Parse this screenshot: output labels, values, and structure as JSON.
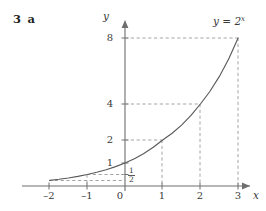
{
  "figure": {
    "question_label": "3 a",
    "function_label_prefix": "y = 2",
    "function_label_exponent": "x",
    "y_axis_label": "y",
    "x_axis_label": "x",
    "origin_label": "0",
    "half_label_numerator": "1",
    "half_label_denominator": "2",
    "line_color": "#6e6e6e",
    "curve_color": "#5a5a5a",
    "dash_color": "#9a9a9a",
    "text_color": "#3a3a3a"
  },
  "chart_data": {
    "type": "line",
    "xlabel": "x",
    "ylabel": "y",
    "xlim": [
      -2.35,
      3.55
    ],
    "ylim": [
      -0.45,
      9.2
    ],
    "grid": false,
    "legend": "none",
    "xticks": [
      -2,
      -1,
      0,
      1,
      2,
      3
    ],
    "xtick_labels": [
      "–2",
      "–1",
      "0",
      "1",
      "2",
      "3"
    ],
    "yticks": [
      1,
      2,
      4,
      8
    ],
    "ytick_labels": [
      "1",
      "2",
      "4",
      "8"
    ],
    "extra_ytick_label": "1/2",
    "series": [
      {
        "name": "y = 2^x",
        "x": [
          -2,
          -1.75,
          -1.5,
          -1.25,
          -1,
          -0.75,
          -0.5,
          -0.25,
          0,
          0.25,
          0.5,
          0.75,
          1,
          1.25,
          1.5,
          1.75,
          2,
          2.25,
          2.5,
          2.75,
          3
        ],
        "y": [
          0.25,
          0.297,
          0.354,
          0.42,
          0.5,
          0.595,
          0.707,
          0.841,
          1,
          1.189,
          1.414,
          1.682,
          2,
          2.378,
          2.828,
          3.364,
          4,
          4.757,
          5.657,
          6.727,
          8
        ]
      }
    ],
    "annotations": [
      {
        "text": "y = 2^x",
        "x": 2.45,
        "y": 8.85
      },
      {
        "text": "guide lines from (1,2), (2,4), (3,8) to axes",
        "x": 0,
        "y": 0
      }
    ],
    "guide_points": [
      {
        "x": 1,
        "y": 2
      },
      {
        "x": 2,
        "y": 4
      },
      {
        "x": 3,
        "y": 8
      },
      {
        "x": 0,
        "y": 1
      },
      {
        "x": -1,
        "y": 0.5
      }
    ]
  }
}
